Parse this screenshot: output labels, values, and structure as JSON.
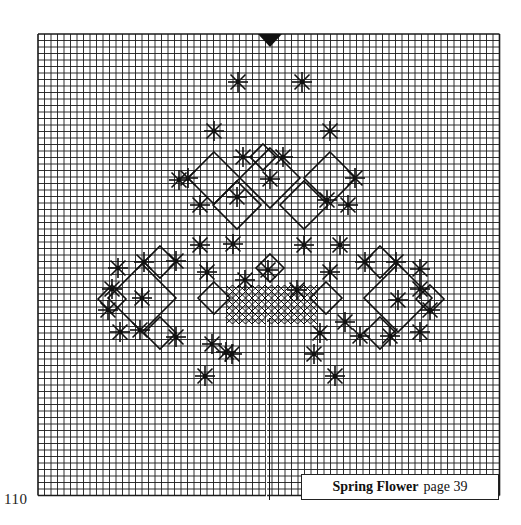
{
  "page": {
    "number": "110",
    "caption": {
      "title": "Spring Flower",
      "reference": "page 39"
    }
  },
  "grid": {
    "left": 38,
    "top": 34,
    "cell": 6.5,
    "cols": 71,
    "rows": 71,
    "line_color": "#1a1a1a",
    "center_marker": {
      "x": 270,
      "y": 34,
      "shape": "down-triangle"
    }
  },
  "colors": {
    "ink": "#111111",
    "paper": "#ffffff",
    "grid": "#1a1a1a"
  },
  "chart_data": {
    "type": "diagram",
    "title": "Spring Flower",
    "stars": [
      [
        238,
        82
      ],
      [
        302,
        82
      ],
      [
        214,
        131
      ],
      [
        330,
        131
      ],
      [
        243,
        157
      ],
      [
        283,
        157
      ],
      [
        188,
        178
      ],
      [
        355,
        178
      ],
      [
        179,
        180
      ],
      [
        200,
        205
      ],
      [
        237,
        197
      ],
      [
        270,
        179
      ],
      [
        327,
        200
      ],
      [
        348,
        205
      ],
      [
        200,
        245
      ],
      [
        233,
        244
      ],
      [
        304,
        245
      ],
      [
        340,
        245
      ],
      [
        144,
        262
      ],
      [
        176,
        261
      ],
      [
        207,
        272
      ],
      [
        245,
        280
      ],
      [
        268,
        270
      ],
      [
        297,
        290
      ],
      [
        330,
        272
      ],
      [
        365,
        262
      ],
      [
        396,
        262
      ],
      [
        420,
        269
      ],
      [
        118,
        268
      ],
      [
        112,
        289
      ],
      [
        108,
        310
      ],
      [
        142,
        298
      ],
      [
        420,
        289
      ],
      [
        430,
        310
      ],
      [
        398,
        300
      ],
      [
        120,
        332
      ],
      [
        140,
        330
      ],
      [
        176,
        337
      ],
      [
        212,
        344
      ],
      [
        232,
        354
      ],
      [
        320,
        333
      ],
      [
        345,
        322
      ],
      [
        360,
        336
      ],
      [
        390,
        336
      ],
      [
        420,
        332
      ],
      [
        205,
        376
      ],
      [
        226,
        352
      ],
      [
        314,
        354
      ],
      [
        335,
        376
      ]
    ],
    "diamonds": [
      {
        "cx": 214,
        "cy": 178,
        "r": 26
      },
      {
        "cx": 330,
        "cy": 178,
        "r": 26
      },
      {
        "cx": 237,
        "cy": 205,
        "r": 24
      },
      {
        "cx": 304,
        "cy": 205,
        "r": 24
      },
      {
        "cx": 270,
        "cy": 178,
        "r": 30
      },
      {
        "cx": 263,
        "cy": 157,
        "r": 13
      },
      {
        "cx": 142,
        "cy": 298,
        "r": 34
      },
      {
        "cx": 398,
        "cy": 298,
        "r": 34
      },
      {
        "cx": 112,
        "cy": 299,
        "r": 14
      },
      {
        "cx": 430,
        "cy": 299,
        "r": 14
      },
      {
        "cx": 160,
        "cy": 262,
        "r": 16
      },
      {
        "cx": 380,
        "cy": 262,
        "r": 16
      },
      {
        "cx": 160,
        "cy": 333,
        "r": 16
      },
      {
        "cx": 380,
        "cy": 333,
        "r": 16
      },
      {
        "cx": 214,
        "cy": 298,
        "r": 16
      },
      {
        "cx": 326,
        "cy": 298,
        "r": 16
      },
      {
        "cx": 270,
        "cy": 268,
        "r": 14
      }
    ],
    "crosshatch": {
      "x1": 226,
      "x2": 316,
      "y1": 285,
      "y2": 318
    },
    "stem": {
      "x": 268,
      "y1": 318,
      "y2": 500
    }
  }
}
